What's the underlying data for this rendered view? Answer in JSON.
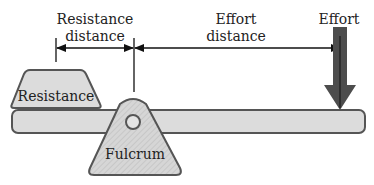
{
  "diagram": {
    "labels": {
      "resistance_distance_line1": "Resistance",
      "resistance_distance_line2": "distance",
      "effort_distance_line1": "Effort",
      "effort_distance_line2": "distance",
      "effort": "Effort",
      "resistance_block": "Resistance",
      "fulcrum": "Fulcrum"
    },
    "colors": {
      "beam_fill": "#d9d9d9",
      "outline": "#555555",
      "effort_arrow": "#4d4d4d",
      "text": "#222222"
    }
  }
}
